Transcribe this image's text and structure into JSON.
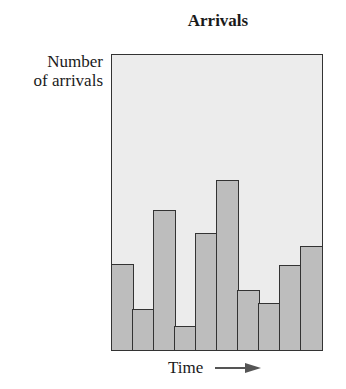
{
  "chart_data": {
    "type": "bar",
    "title": "Arrivals",
    "xlabel": "Time",
    "ylabel": "Number of arrivals",
    "ylabel_lines": [
      "Number",
      "of arrivals"
    ],
    "categories": [
      "1",
      "2",
      "3",
      "4",
      "5",
      "6",
      "7",
      "8",
      "9",
      "10"
    ],
    "values": [
      87,
      41,
      141,
      24,
      118,
      171,
      60,
      47,
      86,
      105
    ],
    "ylim": [
      0,
      297
    ],
    "grid": false,
    "axis_ticks": false,
    "legend": null,
    "annotations": [
      "Time arrow pointing right"
    ]
  },
  "colors": {
    "plot_background": "#ececec",
    "bar_fill": "#bdbdbd",
    "bar_edge": "#333333"
  }
}
